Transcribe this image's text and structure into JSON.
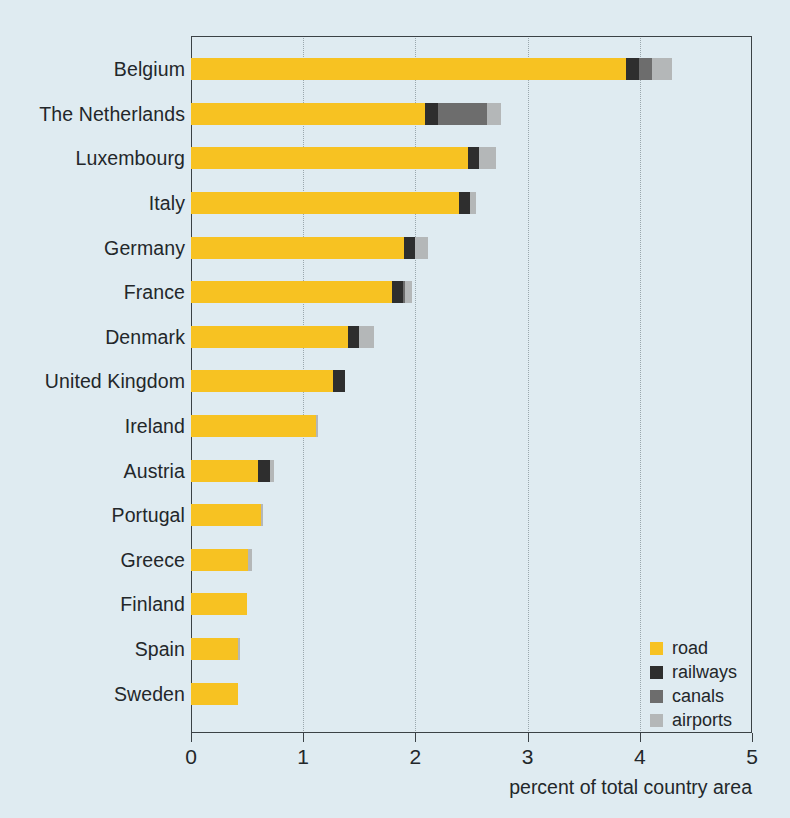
{
  "chart_data": {
    "type": "bar",
    "orientation": "horizontal",
    "stacked": true,
    "title": "",
    "xlabel": "percent of total country area",
    "ylabel": "",
    "xlim": [
      0,
      5
    ],
    "xticks": [
      "0",
      "1",
      "2",
      "3",
      "4",
      "5"
    ],
    "grid": "vertical dotted at 1,2,3,4",
    "legend_position": "inside bottom-right",
    "categories": [
      "Belgium",
      "The Netherlands",
      "Luxembourg",
      "Italy",
      "Germany",
      "France",
      "Denmark",
      "United Kingdom",
      "Ireland",
      "Austria",
      "Portugal",
      "Greece",
      "Finland",
      "Spain",
      "Sweden"
    ],
    "series": [
      {
        "name": "road",
        "color": "#f7c222",
        "values": [
          3.88,
          2.09,
          2.47,
          2.39,
          1.9,
          1.79,
          1.4,
          1.27,
          1.11,
          0.6,
          0.62,
          0.51,
          0.5,
          0.42,
          0.42
        ]
      },
      {
        "name": "railways",
        "color": "#2e2e2e",
        "values": [
          0.11,
          0.11,
          0.1,
          0.1,
          0.1,
          0.1,
          0.1,
          0.1,
          0.0,
          0.1,
          0.0,
          0.0,
          0.0,
          0.0,
          0.0
        ]
      },
      {
        "name": "canals",
        "color": "#6d6d6d",
        "values": [
          0.12,
          0.44,
          0.0,
          0.0,
          0.0,
          0.02,
          0.0,
          0.0,
          0.0,
          0.0,
          0.0,
          0.0,
          0.0,
          0.0,
          0.0
        ]
      },
      {
        "name": "airports",
        "color": "#b4b7b8",
        "values": [
          0.18,
          0.12,
          0.15,
          0.05,
          0.11,
          0.06,
          0.13,
          0.0,
          0.02,
          0.04,
          0.02,
          0.03,
          0.0,
          0.02,
          0.0
        ]
      }
    ],
    "totals": [
      4.29,
      2.76,
      2.72,
      2.54,
      2.11,
      1.97,
      1.63,
      1.37,
      1.13,
      0.74,
      0.64,
      0.54,
      0.5,
      0.44,
      0.42
    ]
  },
  "legend": {
    "items": [
      {
        "label": "road",
        "color": "#f7c222",
        "swatch": "road-swatch"
      },
      {
        "label": "railways",
        "color": "#2e2e2e",
        "swatch": "railways-swatch"
      },
      {
        "label": "canals",
        "color": "#6d6d6d",
        "swatch": "canals-swatch"
      },
      {
        "label": "airports",
        "color": "#b4b7b8",
        "swatch": "airports-swatch"
      }
    ]
  },
  "colors": {
    "background": "#dfebf1",
    "axis": "#3b4246",
    "grid": "#9aa7ad",
    "text": "#23272a",
    "road": "#f7c222",
    "railways": "#2e2e2e",
    "canals": "#6d6d6d",
    "airports": "#b4b7b8"
  }
}
